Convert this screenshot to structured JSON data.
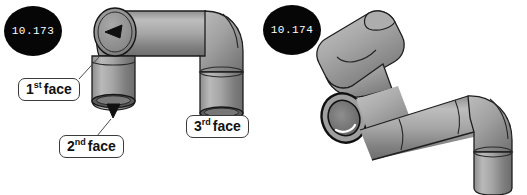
{
  "figure": {
    "background_color": "#ffffff",
    "width": 527,
    "height": 195
  },
  "badges": [
    {
      "name": "badge-left",
      "label": "10.173",
      "shape": "filled-ellipse",
      "fill": "#060606",
      "text_color": "#ffffff"
    },
    {
      "name": "badge-right",
      "label": "10.174",
      "shape": "filled-ellipse",
      "fill": "#060606",
      "text_color": "#ffffff"
    }
  ],
  "callouts": [
    {
      "name": "callout-first",
      "number": "1",
      "ordinal": "st",
      "word": "face",
      "full_text": "1st face"
    },
    {
      "name": "callout-second",
      "number": "2",
      "ordinal": "nd",
      "word": "face",
      "full_text": "2nd face"
    },
    {
      "name": "callout-third",
      "number": "3",
      "ordinal": "rd",
      "word": "face",
      "full_text": "3rd face"
    }
  ],
  "drawings": {
    "left_part": {
      "name": "pipe-assembly-left",
      "description": "Three-segment elbow pipe: open circular face at upper-left with inward arrow, horizontal run to the right, elbow bending down to a vertical leg, and a second vertical leg dropping below the first elbow",
      "colors": {
        "pipe_light": "#b7b7b7",
        "pipe_mid": "#9a9a9a",
        "pipe_dark": "#6f6f6f",
        "outline": "#1e1e1e",
        "bore_dark": "#4a4a4a",
        "arrow": "#101010"
      }
    },
    "right_part": {
      "name": "pipe-assembly-right",
      "description": "Same pipe assembly rotated: tilted upper-left cylinder, annular open ring face at middle-left, long horizontal run and an elbow bending down to a vertical cylinder at bottom right",
      "colors": {
        "pipe_light": "#b7b7b7",
        "pipe_mid": "#9a9a9a",
        "pipe_dark": "#6f6f6f",
        "outline": "#1e1e1e",
        "bore_dark": "#585858"
      }
    }
  },
  "leader_lines": {
    "first_face": "from callout top-right up to the open face at the upper-left of the left assembly",
    "second_face": "from callout top up to the downward arrow at the bottom of the left vertical leg",
    "third_face": "from callout top-left up to the arrow at the bottom of the right vertical leg"
  },
  "arrows": [
    {
      "name": "arrow-first-face",
      "points": "into the upper-left open face, pointing left-down"
    },
    {
      "name": "arrow-second-face",
      "points": "up into the bottom opening of the left vertical leg"
    },
    {
      "name": "arrow-third-face",
      "points": "up-right into the bottom opening of the right vertical leg"
    }
  ]
}
